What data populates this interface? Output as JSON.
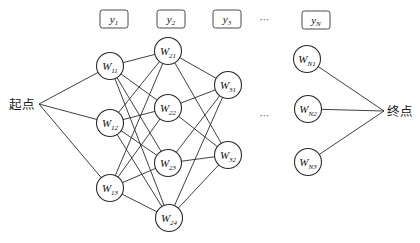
{
  "diagram": {
    "background": "#ffffff",
    "edge_color": "#2b2b2b",
    "node_style": {
      "radius": 13.5,
      "fill": "#ffffff",
      "stroke": "#2b2b2b",
      "label_font_size": 11,
      "sub_font_size": 7
    },
    "box_style": {
      "width": 28,
      "height": 18,
      "corner": 2.5,
      "fill": "#ffffff",
      "stroke": "#4a4a4a"
    },
    "start": {
      "label": "起点",
      "x": 39,
      "y": 104,
      "label_x": 22,
      "label_y": 104
    },
    "end": {
      "label": "终点",
      "x": 384,
      "y": 111,
      "label_x": 400,
      "label_y": 111
    },
    "ellipsis": {
      "glyph": "⋯",
      "positions": [
        {
          "x": 265,
          "y": 20
        },
        {
          "x": 265,
          "y": 116
        }
      ]
    },
    "stage_boxes": [
      {
        "id": "y1",
        "base": "y",
        "sub": "1",
        "x": 114,
        "y": 19
      },
      {
        "id": "y2",
        "base": "y",
        "sub": "2",
        "x": 171,
        "y": 19
      },
      {
        "id": "y3",
        "base": "y",
        "sub": "3",
        "x": 227,
        "y": 19
      },
      {
        "id": "yN",
        "base": "y",
        "sub": "N",
        "x": 316,
        "y": 20
      }
    ],
    "nodes": [
      {
        "id": "W11",
        "base": "W",
        "sub": "11",
        "x": 110,
        "y": 66
      },
      {
        "id": "W12",
        "base": "W",
        "sub": "12",
        "x": 110,
        "y": 123
      },
      {
        "id": "W13",
        "base": "W",
        "sub": "13",
        "x": 110,
        "y": 188
      },
      {
        "id": "W21",
        "base": "W",
        "sub": "21",
        "x": 168,
        "y": 51
      },
      {
        "id": "W22",
        "base": "W",
        "sub": "22",
        "x": 168,
        "y": 108
      },
      {
        "id": "W23",
        "base": "W",
        "sub": "23",
        "x": 168,
        "y": 163
      },
      {
        "id": "W24",
        "base": "W",
        "sub": "24",
        "x": 169,
        "y": 218
      },
      {
        "id": "W31",
        "base": "W",
        "sub": "31",
        "x": 228,
        "y": 85
      },
      {
        "id": "W32",
        "base": "W",
        "sub": "32",
        "x": 228,
        "y": 155
      },
      {
        "id": "WN1",
        "base": "W",
        "sub": "N1",
        "x": 307,
        "y": 59
      },
      {
        "id": "WN2",
        "base": "W",
        "sub": "N2",
        "x": 308,
        "y": 109
      },
      {
        "id": "WN3",
        "base": "W",
        "sub": "N3",
        "x": 308,
        "y": 162
      }
    ],
    "edges": [
      [
        "start",
        "W11"
      ],
      [
        "start",
        "W12"
      ],
      [
        "start",
        "W13"
      ],
      [
        "W11",
        "W21"
      ],
      [
        "W11",
        "W22"
      ],
      [
        "W11",
        "W23"
      ],
      [
        "W11",
        "W24"
      ],
      [
        "W12",
        "W21"
      ],
      [
        "W12",
        "W22"
      ],
      [
        "W12",
        "W23"
      ],
      [
        "W12",
        "W24"
      ],
      [
        "W13",
        "W21"
      ],
      [
        "W13",
        "W22"
      ],
      [
        "W13",
        "W23"
      ],
      [
        "W13",
        "W24"
      ],
      [
        "W21",
        "W31"
      ],
      [
        "W21",
        "W32"
      ],
      [
        "W22",
        "W31"
      ],
      [
        "W22",
        "W32"
      ],
      [
        "W23",
        "W31"
      ],
      [
        "W23",
        "W32"
      ],
      [
        "W24",
        "W31"
      ],
      [
        "W24",
        "W32"
      ],
      [
        "WN1",
        "end"
      ],
      [
        "WN2",
        "end"
      ],
      [
        "WN3",
        "end"
      ]
    ]
  }
}
